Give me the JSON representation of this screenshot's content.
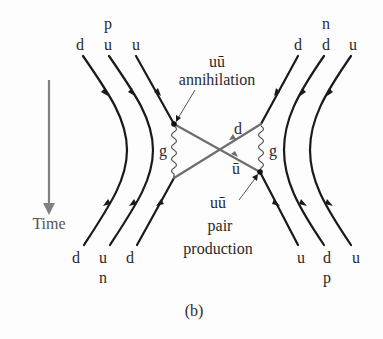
{
  "figure": {
    "caption": "(b)",
    "time_axis": {
      "label": "Time",
      "direction": "down"
    },
    "top_left_hadron": {
      "label": "p",
      "quarks": [
        "d",
        "u",
        "u"
      ]
    },
    "top_right_hadron": {
      "label": "n",
      "quarks": [
        "d",
        "d",
        "u"
      ]
    },
    "bottom_left_hadron": {
      "label": "n",
      "quarks": [
        "d",
        "u",
        "d"
      ]
    },
    "bottom_right_hadron": {
      "label": "p",
      "quarks": [
        "u",
        "d",
        "u"
      ]
    },
    "gluon_label_left": "g",
    "gluon_label_right": "g",
    "exchanged_quark_top": "d",
    "exchanged_quark_bottom": "ū",
    "annihilation": {
      "line1": "uū",
      "line2": "annihilation"
    },
    "pair_production": {
      "line1": "uū",
      "line2": "pair",
      "line3": "production"
    },
    "colors": {
      "quark_line": "#1a1a1a",
      "exchange_line": "#6e6e6e",
      "time_arrow": "#808080",
      "text": "#2a2a2a"
    }
  }
}
